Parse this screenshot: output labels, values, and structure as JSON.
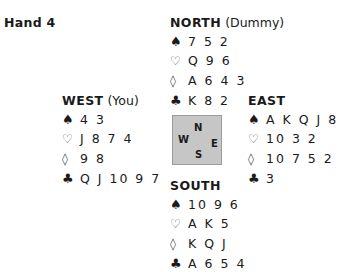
{
  "title": "Hand 4",
  "suit_icons": {
    "spades": "♠",
    "hearts": "♡",
    "diamonds": "◊",
    "clubs": "♣"
  },
  "compass": {
    "n": "N",
    "w": "W",
    "e": "E",
    "s": "S"
  },
  "hands": {
    "north": {
      "name": "NORTH",
      "role": "(Dummy)",
      "spades": "7 5 2",
      "hearts": "Q 9 6",
      "diamonds": "A 6 4 3",
      "clubs": "K 8 2"
    },
    "west": {
      "name": "WEST",
      "role": "(You)",
      "spades": "4 3",
      "hearts": "J 8 7 4",
      "diamonds": "9 8",
      "clubs": "Q J 10 9 7"
    },
    "east": {
      "name": "EAST",
      "role": "",
      "spades": "A K Q J 8",
      "hearts": "10 3 2",
      "diamonds": "10 7 5 2",
      "clubs": "3"
    },
    "south": {
      "name": "SOUTH",
      "role": "",
      "spades": "10 9 6",
      "hearts": "A K 5",
      "diamonds": "K Q J",
      "clubs": "A 6 5 4"
    }
  }
}
